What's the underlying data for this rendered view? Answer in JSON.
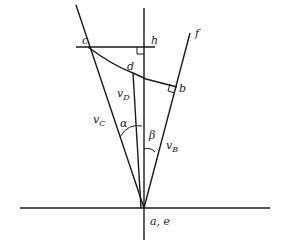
{
  "diagram": {
    "type": "geometry-velocity-diagram",
    "points": {
      "c": "c",
      "h": "h",
      "d": "d",
      "b": "b",
      "f": "f",
      "origin": "a, e"
    },
    "vectors": {
      "vC": {
        "main": "v",
        "sub": "C"
      },
      "vD": {
        "main": "v",
        "sub": "D"
      },
      "vB": {
        "main": "v",
        "sub": "B"
      }
    },
    "angles": {
      "alpha": "α",
      "beta": "β"
    },
    "colors": {
      "line": "#1a1a1a",
      "background": "#ffffff"
    }
  }
}
